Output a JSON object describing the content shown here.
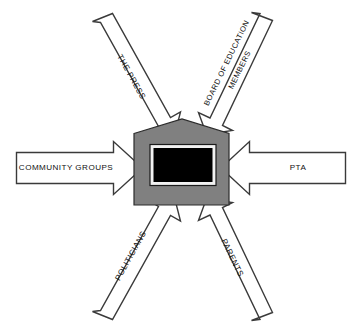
{
  "diagram": {
    "center": {
      "name": "school-building",
      "shape": "house",
      "fill_color": "#808080",
      "window_color": "#000000",
      "window_border_color": "#f2f2f2"
    },
    "arrow_color": "#ffffff",
    "arrow_outline_color": "#3a3a3a",
    "background_color": "#ffffff",
    "arrows": [
      {
        "id": "the-press",
        "label": "THE PRESS",
        "lines": [
          "THE PRESS"
        ],
        "direction": "top-left-to-center",
        "angle_deg": 52
      },
      {
        "id": "board-of-education-members",
        "label": "BOARD OF EDUCATION MEMBERS",
        "lines": [
          "BOARD OF EDUCATION",
          "MEMBERS"
        ],
        "direction": "top-right-to-center",
        "angle_deg": -56
      },
      {
        "id": "community-groups",
        "label": "COMMUNITY GROUPS",
        "lines": [
          "COMMUNITY GROUPS"
        ],
        "direction": "left-to-center",
        "angle_deg": 0
      },
      {
        "id": "pta",
        "label": "PTA",
        "lines": [
          "PTA"
        ],
        "direction": "right-to-center",
        "angle_deg": 0
      },
      {
        "id": "politicians",
        "label": "POLITICIANS",
        "lines": [
          "POLITICIANS"
        ],
        "direction": "bottom-left-to-center",
        "angle_deg": -56
      },
      {
        "id": "parents",
        "label": "PARENTS",
        "lines": [
          "PARENTS"
        ],
        "direction": "bottom-right-to-center",
        "angle_deg": 56
      }
    ]
  }
}
